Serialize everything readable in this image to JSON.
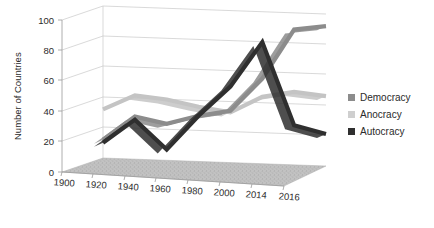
{
  "chart_data": {
    "type": "line",
    "title": "",
    "subtitle": "",
    "xlabel": "",
    "ylabel": "Number of Countries",
    "categories": [
      "1900",
      "1920",
      "1940",
      "1960",
      "1980",
      "2000",
      "2014",
      "2016"
    ],
    "ylim": [
      0,
      100
    ],
    "yticks": [
      "0",
      "20",
      "40",
      "60",
      "80",
      "100"
    ],
    "grid": true,
    "legend_position": "right",
    "three_d": true,
    "series": [
      {
        "name": "Democracy",
        "color": "#8c8c8c",
        "values": [
          12,
          28,
          24,
          30,
          34,
          56,
          89,
          92
        ]
      },
      {
        "name": "Anocracy",
        "color": "#c4c4c4",
        "values": [
          32,
          42,
          40,
          36,
          33,
          44,
          48,
          46
        ]
      },
      {
        "name": "Autocracy",
        "color": "#2f2f2f",
        "values": [
          10,
          26,
          7,
          30,
          50,
          80,
          26,
          21
        ]
      }
    ]
  },
  "legend": {
    "items": [
      {
        "label": "Democracy",
        "marker_color": "#8c8c8c"
      },
      {
        "label": "Anocracy",
        "marker_color": "#cfcfcf"
      },
      {
        "label": "Autocracy",
        "marker_color": "#2f2f2f"
      }
    ]
  },
  "axes": {
    "y_title": "Number of Countries",
    "y_ticks": [
      "100",
      "80",
      "60",
      "40",
      "20",
      "0"
    ],
    "x_ticks": [
      "1900",
      "1920",
      "1940",
      "1960",
      "1980",
      "2000",
      "2014",
      "2016"
    ]
  },
  "floor": {
    "fill_color": "#bdbdbd"
  }
}
